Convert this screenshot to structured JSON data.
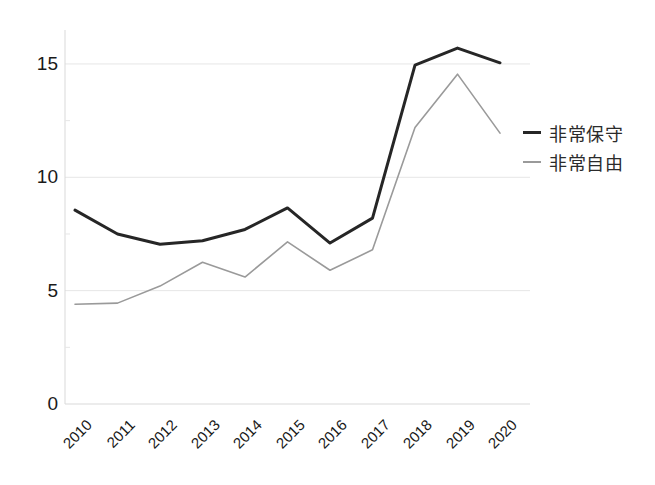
{
  "chart_data": {
    "type": "line",
    "title": "",
    "subtitle": "",
    "xlabel": "",
    "ylabel": "",
    "categories": [
      "2010",
      "2011",
      "2012",
      "2013",
      "2014",
      "2015",
      "2016",
      "2017",
      "2018",
      "2019",
      "2020"
    ],
    "series": [
      {
        "name": "非常保守",
        "color": "#262626",
        "values": [
          8.55,
          7.5,
          7.05,
          7.2,
          7.7,
          8.65,
          7.1,
          8.2,
          14.95,
          15.7,
          15.05
        ]
      },
      {
        "name": "非常自由",
        "color": "#9a9a9a",
        "values": [
          4.4,
          4.45,
          5.2,
          6.25,
          5.6,
          7.15,
          5.9,
          6.8,
          12.2,
          14.55,
          11.95
        ]
      }
    ],
    "ylim": [
      0,
      16.5
    ],
    "yticks": [
      "0",
      "5",
      "10",
      "15"
    ],
    "ytick_values": [
      0,
      5,
      10,
      15
    ],
    "grid": true,
    "grid_axis": "y",
    "legend_position": "right"
  },
  "legend": {
    "items": [
      {
        "label": "非常保守",
        "marker": "line-swatch-dark"
      },
      {
        "label": "非常自由",
        "marker": "line-swatch-light"
      }
    ]
  },
  "colors": {
    "series_conservative": "#262626",
    "series_liberal": "#9a9a9a",
    "gridline": "#e6e6e6",
    "axis": "#d9d9d9",
    "text": "#1a1a1a",
    "background": "#ffffff"
  }
}
